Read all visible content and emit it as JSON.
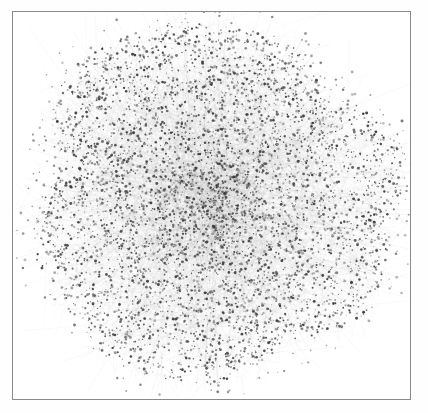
{
  "figure": {
    "kind": "network-graph",
    "title": "",
    "caption": "",
    "width": 428,
    "height": 413,
    "background_color": "#fefefe"
  },
  "frame": {
    "present": true,
    "left": 12,
    "top": 11,
    "right": 411,
    "bottom": 400,
    "border_color": "#8a8a8a",
    "border_width": 1,
    "fill_color": "#ffffff"
  },
  "chart_data": {
    "type": "scatter",
    "subtype": "force-directed-network-hairball",
    "title": "",
    "subtitle": "",
    "xlabel": "",
    "ylabel": "",
    "grid": false,
    "axes_visible": false,
    "tick_labels_x": [],
    "tick_labels_y": [],
    "legend": [],
    "legend_position": "none",
    "annotations": [],
    "xlim": [
      0,
      428
    ],
    "ylim": [
      0,
      413
    ],
    "layout": {
      "center_x": 212,
      "center_y": 201,
      "radius_x": 176,
      "radius_y": 175,
      "core_radius_fraction": 0.58,
      "density_falloff_exponent": 0.62,
      "shape": "round-blob"
    },
    "nodes": {
      "count": 5200,
      "marker": "dot",
      "size_min": 0.55,
      "size_max": 1.5,
      "color": "#3a3a3a",
      "color_light": "#8e8e8e",
      "opacity_min": 0.35,
      "opacity_max": 0.95
    },
    "edges": {
      "count": 9800,
      "color": "#b4b4b4",
      "width": 0.4,
      "opacity_min": 0.1,
      "opacity_max": 0.42,
      "short_link_fraction": 0.86,
      "long_radial_link_fraction": 0.05,
      "max_short_length": 26,
      "max_long_length": 95
    },
    "stray": {
      "count": 340,
      "radius_min_fraction": 0.92,
      "radius_max_fraction": 1.16,
      "color": "#6b6b6b",
      "tether_opacity": 0.3
    },
    "random_seed": 20240517
  }
}
